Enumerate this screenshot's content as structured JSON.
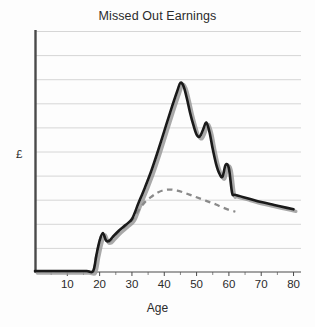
{
  "chart_data": {
    "type": "line",
    "title": "Missed Out Earnings",
    "xlabel": "Age",
    "ylabel": "£",
    "xlim": [
      0,
      82
    ],
    "ylim": [
      0,
      10
    ],
    "grid": true,
    "gridlines_y": [
      1,
      2,
      3,
      4,
      5,
      6,
      7,
      8,
      9,
      10
    ],
    "xticks": [
      10,
      20,
      30,
      40,
      50,
      60,
      70,
      80
    ],
    "xtick_labels": [
      "10",
      "20",
      "30",
      "40",
      "50",
      "60",
      "70",
      "80"
    ],
    "ytick_labels": [],
    "legend": null,
    "legend_position": "none",
    "annotations": [],
    "series": [
      {
        "name": "Full career earnings",
        "style": "solid",
        "color": "#1a1a1a",
        "shadow_color": "#9a9a9a",
        "x": [
          0,
          4,
          8,
          12,
          16,
          18,
          19,
          20,
          21,
          22,
          23,
          24,
          26,
          28,
          30,
          32,
          34,
          36,
          38,
          40,
          42,
          44,
          45,
          46,
          47,
          48,
          49,
          50,
          51,
          52,
          53,
          54,
          55,
          56,
          57,
          58,
          59,
          60,
          61,
          62,
          66,
          70,
          74,
          78,
          80
        ],
        "y": [
          0.04,
          0.04,
          0.04,
          0.04,
          0.04,
          0.04,
          0.7,
          1.3,
          1.62,
          1.3,
          1.3,
          1.45,
          1.72,
          1.95,
          2.2,
          2.85,
          3.5,
          4.2,
          5.0,
          5.85,
          6.7,
          7.5,
          7.85,
          7.7,
          7.2,
          6.6,
          6.1,
          5.7,
          5.62,
          5.9,
          6.2,
          5.8,
          5.1,
          4.5,
          4.1,
          3.95,
          4.45,
          4.3,
          3.28,
          3.2,
          3.05,
          2.9,
          2.78,
          2.66,
          2.6
        ]
      },
      {
        "name": "Reduced earnings after career break",
        "style": "dashed",
        "color": "#8a8a8a",
        "x": [
          0,
          4,
          8,
          12,
          16,
          18,
          19,
          20,
          21,
          22,
          23,
          24,
          26,
          28,
          30,
          32,
          34,
          36,
          38,
          40,
          42,
          44,
          46,
          48,
          50,
          52,
          54,
          56,
          58,
          60,
          62
        ],
        "y": [
          0.04,
          0.04,
          0.04,
          0.04,
          0.04,
          0.04,
          0.7,
          1.3,
          1.62,
          1.28,
          1.26,
          1.4,
          1.68,
          1.9,
          2.15,
          2.55,
          2.9,
          3.12,
          3.3,
          3.4,
          3.42,
          3.38,
          3.3,
          3.2,
          3.1,
          3.0,
          2.9,
          2.8,
          2.68,
          2.58,
          2.5
        ]
      }
    ]
  },
  "geometry": {
    "plot_left": 35,
    "plot_right": 300,
    "plot_top": 31,
    "plot_bottom": 272
  }
}
